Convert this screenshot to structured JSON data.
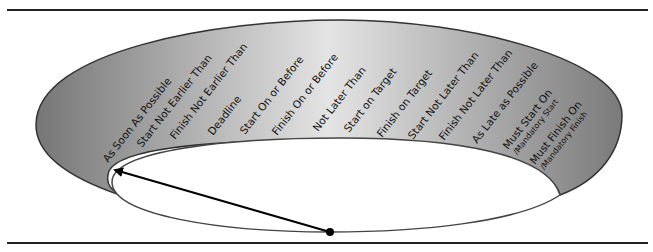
{
  "diagram": {
    "constraints": [
      {
        "label": "As Soon As Possible"
      },
      {
        "label": "Start Not Earlier Than"
      },
      {
        "label": "Finish Not Earlier Than"
      },
      {
        "label": "Deadline"
      },
      {
        "label": "Start On or Before"
      },
      {
        "label": "Finish On or Before"
      },
      {
        "label": "Not Later Than"
      },
      {
        "label": "Start on Target"
      },
      {
        "label": "Finish on Target"
      },
      {
        "label": "Start Not Later Than"
      },
      {
        "label": "Finish Not Later Than"
      },
      {
        "label": "As Late as Possible"
      },
      {
        "label": "Must Start On",
        "sublabel": "/Mandatory Start"
      },
      {
        "label": "Must Finish On",
        "sublabel": "/Mandatory Finish"
      }
    ],
    "pointer": {
      "points_to": "As Soon As Possible",
      "icon": "arrow-icon"
    },
    "colors": {
      "band_dark": "#7a7a7a",
      "band_light": "#e6e6e6",
      "outline": "#333333",
      "arrow": "#000000"
    }
  }
}
